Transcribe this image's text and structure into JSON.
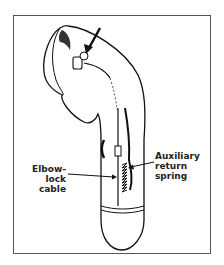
{
  "figure": {
    "labels": {
      "elbow_lock_cable_line1": "Elbow-lock",
      "elbow_lock_cable_line2": "cable",
      "aux_spring_line1": "Auxiliary",
      "aux_spring_line2": "return spring"
    }
  }
}
